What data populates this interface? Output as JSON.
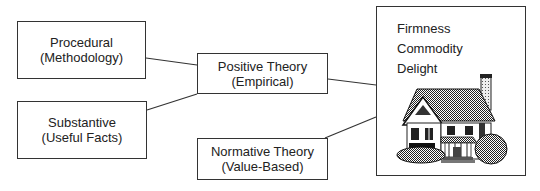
{
  "diagram": {
    "boxes": {
      "procedural": {
        "line1": "Procedural",
        "line2": "(Methodology)"
      },
      "substantive": {
        "line1": "Substantive",
        "line2": "(Useful Facts)"
      },
      "positive": {
        "line1": "Positive Theory",
        "line2": "(Empirical)"
      },
      "normative": {
        "line1": "Normative Theory",
        "line2": "(Value-Based)"
      }
    },
    "outcome": {
      "qualities": [
        "Firmness",
        "Commodity",
        "Delight"
      ],
      "image": "house-illustration"
    },
    "connections": [
      {
        "from": "procedural",
        "to": "positive"
      },
      {
        "from": "substantive",
        "to": "positive"
      },
      {
        "from": "positive",
        "to": "outcome"
      },
      {
        "from": "normative",
        "to": "outcome"
      }
    ]
  }
}
